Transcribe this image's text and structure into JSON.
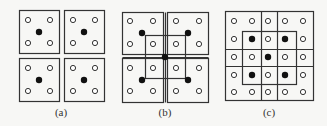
{
  "figure": {
    "panels": [
      {
        "id": "a",
        "caption": "(a)",
        "caption_x": 61,
        "rects": [
          {
            "x": 19,
            "y": 10,
            "w": 40,
            "h": 43
          },
          {
            "x": 64,
            "y": 10,
            "w": 40,
            "h": 43
          },
          {
            "x": 19,
            "y": 58,
            "w": 40,
            "h": 43
          },
          {
            "x": 64,
            "y": 58,
            "w": 40,
            "h": 43
          }
        ],
        "lines": [],
        "open_circles": [
          [
            28,
            20
          ],
          [
            50,
            20
          ],
          [
            28,
            43
          ],
          [
            50,
            43
          ],
          [
            73,
            20
          ],
          [
            95,
            20
          ],
          [
            73,
            43
          ],
          [
            95,
            43
          ],
          [
            28,
            68
          ],
          [
            50,
            68
          ],
          [
            28,
            91
          ],
          [
            50,
            91
          ],
          [
            73,
            68
          ],
          [
            95,
            68
          ],
          [
            73,
            91
          ],
          [
            95,
            91
          ]
        ],
        "filled_dots": [
          [
            39,
            32
          ],
          [
            84,
            32
          ],
          [
            39,
            80
          ],
          [
            84,
            80
          ]
        ]
      },
      {
        "id": "b",
        "caption": "(b)",
        "caption_x": 165,
        "rects": [
          {
            "x": 122,
            "y": 12,
            "w": 41,
            "h": 42
          },
          {
            "x": 167,
            "y": 12,
            "w": 41,
            "h": 42
          },
          {
            "x": 122,
            "y": 58,
            "w": 41,
            "h": 44
          },
          {
            "x": 167,
            "y": 58,
            "w": 41,
            "h": 44
          },
          {
            "x": 145,
            "y": 35,
            "w": 40,
            "h": 43
          }
        ],
        "lines": [
          [
            122,
            57,
            208,
            57
          ],
          [
            165,
            12,
            165,
            102
          ]
        ],
        "open_circles": [
          [
            130,
            21
          ],
          [
            153,
            21
          ],
          [
            130,
            44
          ],
          [
            153,
            44
          ],
          [
            176,
            21
          ],
          [
            199,
            21
          ],
          [
            176,
            44
          ],
          [
            199,
            44
          ],
          [
            130,
            68
          ],
          [
            153,
            68
          ],
          [
            130,
            91
          ],
          [
            153,
            91
          ],
          [
            176,
            68
          ],
          [
            199,
            68
          ],
          [
            176,
            91
          ],
          [
            199,
            91
          ]
        ],
        "filled_dots": [
          [
            142,
            33
          ],
          [
            188,
            33
          ],
          [
            165,
            57
          ],
          [
            142,
            80
          ],
          [
            188,
            80
          ]
        ]
      },
      {
        "id": "c",
        "caption": "(c)",
        "caption_x": 269,
        "rects": [
          {
            "x": 225,
            "y": 11,
            "w": 88,
            "h": 89
          },
          {
            "x": 242,
            "y": 31,
            "w": 54,
            "h": 53
          }
        ],
        "lines": [
          [
            261,
            11,
            261,
            100
          ],
          [
            277,
            11,
            277,
            100
          ],
          [
            225,
            49,
            313,
            49
          ],
          [
            225,
            66,
            313,
            66
          ]
        ],
        "open_circles": [
          [
            234,
            21
          ],
          [
            252,
            21
          ],
          [
            268,
            21
          ],
          [
            285,
            21
          ],
          [
            303,
            21
          ],
          [
            234,
            39
          ],
          [
            268,
            39
          ],
          [
            303,
            39
          ],
          [
            234,
            57
          ],
          [
            252,
            57
          ],
          [
            285,
            57
          ],
          [
            303,
            57
          ],
          [
            234,
            75
          ],
          [
            268,
            75
          ],
          [
            303,
            75
          ],
          [
            234,
            92
          ],
          [
            252,
            92
          ],
          [
            268,
            92
          ],
          [
            285,
            92
          ],
          [
            303,
            92
          ]
        ],
        "filled_dots": [
          [
            252,
            39
          ],
          [
            285,
            39
          ],
          [
            268,
            57
          ],
          [
            252,
            75
          ],
          [
            285,
            75
          ]
        ]
      }
    ],
    "style": {
      "stroke": "#333333",
      "fill_dot": "#111111",
      "open_fill": "#ffffff",
      "background": "#f7f7f5"
    }
  }
}
